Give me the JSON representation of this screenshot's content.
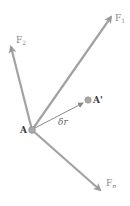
{
  "diagram": {
    "title": "",
    "colors": {
      "arrow": "#9a9a9a",
      "displacement": "#8a8a8a",
      "point": "#a0a0a0",
      "label": "#8a8a8a"
    },
    "point_A": {
      "label": "A",
      "x": 32,
      "y": 130
    },
    "point_A_prime": {
      "label": "A'",
      "x": 88,
      "y": 100
    },
    "displacement": {
      "label": "δr",
      "from": "A",
      "to": "A'"
    },
    "forces": [
      {
        "name": "F",
        "subscript": "1",
        "tip": [
          112,
          16
        ]
      },
      {
        "name": "F",
        "subscript": "2",
        "tip": [
          10,
          45
        ]
      },
      {
        "name": "F",
        "subscript": "n",
        "tip": [
          101,
          192
        ]
      }
    ]
  }
}
